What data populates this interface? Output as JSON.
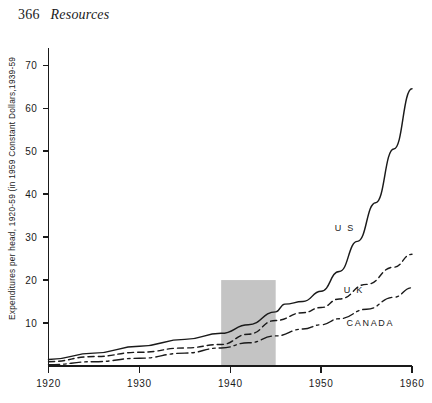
{
  "page": {
    "folio": "366",
    "running_head": "Resources"
  },
  "chart_data": {
    "type": "line",
    "title": "",
    "xlabel": "",
    "ylabel": "Expenditures per head, 1920-59 (in 1959 Constant Dollars,1939-59",
    "xlim": [
      1920,
      1960
    ],
    "ylim": [
      0,
      74
    ],
    "grid": false,
    "legend_position": "inline-right",
    "x_ticks": [
      1920,
      1930,
      1940,
      1950,
      1960
    ],
    "x_tick_labels": [
      "1920",
      "1930",
      "1940",
      "1950",
      "1960"
    ],
    "y_ticks": [
      10,
      20,
      30,
      40,
      50,
      60,
      70
    ],
    "y_tick_labels": [
      "10",
      "20",
      "30",
      "40",
      "50",
      "60",
      "70"
    ],
    "annotations": [
      {
        "name": "war-years-band",
        "label": "",
        "x_start": 1939,
        "x_end": 1945,
        "y_start": 0,
        "y_end": 20,
        "color": "#b4b4b4"
      }
    ],
    "series": [
      {
        "name": "U S",
        "style": "solid",
        "label_x": 1951.5,
        "label_y": 31.5,
        "x": [
          1920,
          1925,
          1930,
          1935,
          1939,
          1942,
          1945,
          1946,
          1948,
          1950,
          1952,
          1954,
          1956,
          1958,
          1960
        ],
        "values": [
          1.5,
          3.0,
          4.6,
          6.2,
          7.6,
          9.6,
          12.6,
          14.4,
          15.0,
          17.4,
          22.0,
          29.0,
          38.0,
          50.5,
          64.5
        ]
      },
      {
        "name": "U K",
        "style": "dashed",
        "label_x": 1952.5,
        "label_y": 17.0,
        "x": [
          1920,
          1925,
          1930,
          1935,
          1939,
          1942,
          1945,
          1948,
          1950,
          1952,
          1955,
          1958,
          1960
        ],
        "values": [
          1.0,
          2.2,
          3.2,
          4.2,
          5.0,
          7.4,
          10.6,
          12.4,
          13.6,
          15.6,
          19.0,
          23.0,
          26.0
        ]
      },
      {
        "name": "CANADA",
        "style": "dash-dot",
        "label_x": 1952.8,
        "label_y": 9.2,
        "x": [
          1920,
          1925,
          1930,
          1935,
          1939,
          1942,
          1945,
          1948,
          1950,
          1952,
          1955,
          1958,
          1960
        ],
        "values": [
          0.3,
          1.0,
          1.8,
          3.0,
          4.2,
          5.4,
          7.0,
          8.6,
          9.6,
          11.0,
          13.2,
          16.0,
          18.2
        ]
      }
    ]
  }
}
